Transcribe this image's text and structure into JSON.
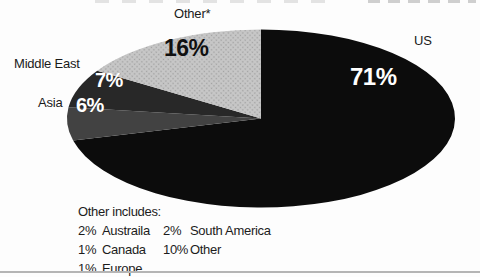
{
  "page": {
    "background_color": "#fdfdfd",
    "bottom_rule_color": "#b5b5b5",
    "text_color": "#1a1a1a"
  },
  "chart_data": {
    "type": "pie",
    "style": "flattened-ellipse-3d-look",
    "start_angle_deg": 0,
    "direction": "clockwise",
    "legend_position": "labels-around-pie",
    "slices": [
      {
        "name": "US",
        "value": 71,
        "display": "71%",
        "color": "#0c0c0c",
        "value_label_color": "#ffffff"
      },
      {
        "name": "Asia",
        "value": 6,
        "display": "6%",
        "color": "#424242",
        "value_label_color": "#ffffff"
      },
      {
        "name": "Middle East",
        "value": 7,
        "display": "7%",
        "color": "#282828",
        "value_label_color": "#ffffff"
      },
      {
        "name": "Other*",
        "value": 16,
        "display": "16%",
        "color": "#c7c7c7",
        "texture": "halftone-dots",
        "texture_dot_color": "#a2a2a2",
        "value_label_color": "#101010"
      }
    ]
  },
  "footnote": {
    "heading": "Other includes:",
    "items": [
      {
        "pct": "2%",
        "name": "Austraila"
      },
      {
        "pct": "1%",
        "name": "Canada"
      },
      {
        "pct": "1%",
        "name": "Europe"
      },
      {
        "pct": "2%",
        "name": "South America"
      },
      {
        "pct": "10%",
        "name": "Other"
      }
    ]
  }
}
